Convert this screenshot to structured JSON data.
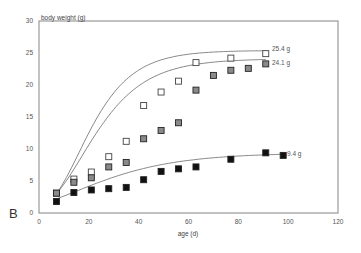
{
  "panel_label": "B",
  "chart_data": {
    "type": "scatter",
    "title": "",
    "xlabel": "age (d)",
    "ylabel": "body weight (g)",
    "xlim": [
      0,
      120
    ],
    "ylim": [
      0,
      30
    ],
    "xticks": [
      0,
      20,
      40,
      60,
      80,
      100,
      120
    ],
    "yticks": [
      0,
      5,
      10,
      15,
      20,
      25,
      30
    ],
    "grid": false,
    "legend": "none; fitted curves end-labeled with asymptotic weights",
    "series": [
      {
        "name": "25.4 g",
        "marker": "open-square",
        "fill": "#ffffff",
        "fit_asymptote": 25.4,
        "x": [
          7,
          14,
          21,
          28,
          35,
          42,
          49,
          56,
          63,
          77,
          91
        ],
        "y": [
          3.1,
          5.3,
          6.4,
          8.8,
          11.2,
          16.8,
          18.9,
          20.6,
          23.5,
          24.2,
          24.9
        ]
      },
      {
        "name": "24.1 g",
        "marker": "gray-square",
        "fill": "#8a8a8a",
        "fit_asymptote": 24.1,
        "x": [
          7,
          14,
          21,
          28,
          35,
          42,
          49,
          56,
          63,
          70,
          77,
          84,
          91
        ],
        "y": [
          3.1,
          4.8,
          5.5,
          7.2,
          7.9,
          11.6,
          12.9,
          14.1,
          19.2,
          21.5,
          22.3,
          22.6,
          23.3
        ]
      },
      {
        "name": "9.4 g",
        "marker": "filled-square",
        "fill": "#111111",
        "fit_asymptote": 9.4,
        "x": [
          7,
          14,
          21,
          28,
          35,
          42,
          49,
          56,
          63,
          77,
          91,
          98
        ],
        "y": [
          1.8,
          3.2,
          3.6,
          3.8,
          4.0,
          5.2,
          6.5,
          6.9,
          7.2,
          8.4,
          9.4,
          9.0
        ]
      }
    ]
  }
}
